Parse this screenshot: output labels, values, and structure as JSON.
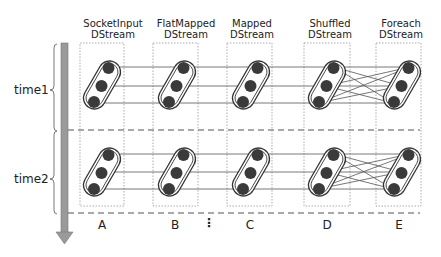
{
  "diagram": {
    "columns": [
      {
        "header_line1": "SocketInput",
        "header_line2": "DStream",
        "label": "A"
      },
      {
        "header_line1": "FlatMapped",
        "header_line2": "DStream",
        "label": "B"
      },
      {
        "header_line1": "Mapped",
        "header_line2": "DStream",
        "label": "C"
      },
      {
        "header_line1": "Shuffled",
        "header_line2": "DStream",
        "label": "D"
      },
      {
        "header_line1": "Foreach",
        "header_line2": "DStream",
        "label": "E"
      }
    ],
    "ellipsis": "⋮",
    "time_labels": [
      "time1",
      "time2"
    ],
    "partitions_per_rdd": 3,
    "colors": {
      "node": "#3a3a3a",
      "line": "#555555",
      "box": "#999999",
      "arrow": "#8a8a8a"
    }
  }
}
